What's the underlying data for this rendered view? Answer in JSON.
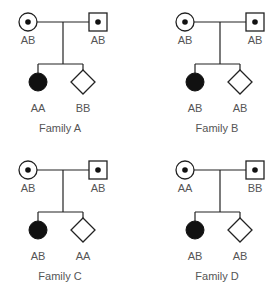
{
  "families": [
    {
      "name": "Family A",
      "mother": "AB",
      "father": "AB",
      "child1": "AA",
      "child2": "BB"
    },
    {
      "name": "Family B",
      "mother": "AB",
      "father": "AB",
      "child1": "AB",
      "child2": "AB"
    },
    {
      "name": "Family C",
      "mother": "AB",
      "father": "AB",
      "child1": "AB",
      "child2": "AA"
    },
    {
      "name": "Family D",
      "mother": "AA",
      "father": "BB",
      "child1": "AB",
      "child2": "AB"
    }
  ],
  "legend": {
    "carrier_female": "circle with dot",
    "carrier_male": "square with dot",
    "affected_female": "filled circle",
    "unknown_sex": "diamond"
  },
  "colors": {
    "line": "#222222",
    "text": "#555555",
    "fill": "#111111"
  }
}
